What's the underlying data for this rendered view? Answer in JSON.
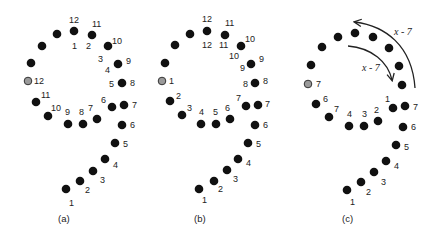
{
  "figure": {
    "colors": {
      "dot": "#111111",
      "start_dot": "#9a9a9a",
      "start_dot_stroke": "#333333",
      "text": "#222222"
    },
    "panels": [
      {
        "caption": "(a)",
        "start_label": "12",
        "loop_outer_labels": [
          "12",
          "11",
          "10",
          "9",
          "8",
          "7"
        ],
        "loop_inner_labels": [
          "1",
          "2",
          "3",
          "4",
          "5",
          "6"
        ],
        "lower_loop_labels": [
          "11",
          "10",
          "9",
          "8",
          "7"
        ],
        "tail_labels": [
          "6",
          "5",
          "4",
          "3",
          "2",
          "1"
        ]
      },
      {
        "caption": "(b)",
        "start_label": "1",
        "loop_outer_labels": [
          "12",
          "11",
          "10",
          "9",
          "8",
          "7"
        ],
        "loop_inner_labels": [
          "12",
          "11",
          "10",
          "9",
          "8",
          "7"
        ],
        "lower_loop_labels": [
          "2",
          "3",
          "4",
          "5",
          "6"
        ],
        "tail_labels": [
          "6",
          "5",
          "4",
          "3",
          "2",
          "1"
        ]
      },
      {
        "caption": "(c)",
        "start_label": "7",
        "loop_inner_labels": [
          "1",
          "7"
        ],
        "lower_loop_labels": [
          "6",
          "7",
          "4",
          "3",
          "2"
        ],
        "tail_labels": [
          "6",
          "5",
          "4",
          "3",
          "2",
          "1"
        ],
        "arrows": [
          {
            "label": "x - 7",
            "kind": "outer-arc-counterclockwise"
          },
          {
            "label": "x - 7",
            "kind": "inner-arc-clockwise"
          }
        ]
      }
    ]
  }
}
